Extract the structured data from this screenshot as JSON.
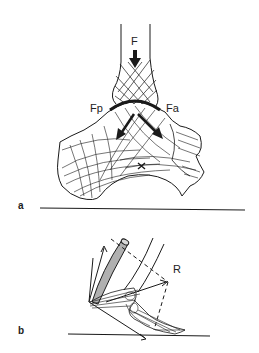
{
  "figure": {
    "panel_a": {
      "label": "a",
      "force_labels": {
        "F": "F",
        "Fp": "Fp",
        "Fa": "Fa"
      },
      "marker": "×"
    },
    "panel_b": {
      "label": "b",
      "force_labels": {
        "R": "R"
      }
    },
    "colors": {
      "ink": "#1a1a1a",
      "tendon": "#b0b0b0",
      "background": "#ffffff"
    }
  }
}
